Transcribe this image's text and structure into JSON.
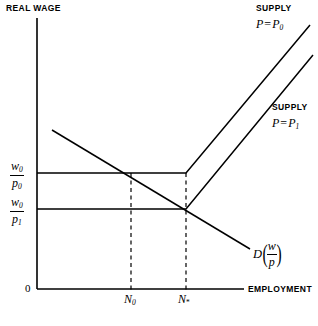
{
  "figure": {
    "kind": "economics-labor-market-diagram",
    "background_color": "#ffffff",
    "line_color": "#000000",
    "width": 318,
    "height": 326
  },
  "axes": {
    "y_axis_title": "REAL WAGE",
    "x_axis_title": "EMPLOYMENT",
    "origin_label": "0",
    "y_axis": {
      "x": 37,
      "y_top": 18,
      "y_bottom": 289
    },
    "x_axis": {
      "y": 289,
      "x_left": 37,
      "x_right": 244
    }
  },
  "y_ticks": [
    {
      "id": "w0-over-p0",
      "numerator": "w",
      "numerator_sub": "0",
      "denominator": "p",
      "denominator_sub": "0",
      "value_y": 173
    },
    {
      "id": "w0-over-p1",
      "numerator": "w",
      "numerator_sub": "0",
      "denominator": "p",
      "denominator_sub": "1",
      "value_y": 209
    }
  ],
  "x_ticks": [
    {
      "id": "N0",
      "base": "N",
      "sub": "0",
      "value_x": 131
    },
    {
      "id": "Nstar",
      "base": "N",
      "sub": "*",
      "value_x": 186
    }
  ],
  "curves": {
    "supply_p0": {
      "title_line1": "SUPPLY",
      "title_var": "P",
      "title_eq": "=",
      "title_val": "P",
      "title_val_sub": "0",
      "points": "37,173 186,173 310,25"
    },
    "supply_p1": {
      "title_line1": "SUPPLY",
      "title_var": "P",
      "title_eq": "=",
      "title_val": "P",
      "title_val_sub": "1",
      "points": "37,209 186,209 313,55"
    },
    "demand": {
      "label_d": "D",
      "label_open_paren": "(",
      "label_num": "w",
      "label_den": "p",
      "label_close_paren": ")",
      "points": "52,130 250,249"
    }
  },
  "dashed_guides": [
    {
      "id": "guide-N0",
      "x": 131,
      "y_top": 173,
      "y_bottom": 289
    },
    {
      "id": "guide-Nstar",
      "x": 186,
      "y_top": 173,
      "y_bottom": 289
    }
  ],
  "chart_data": {
    "type": "line",
    "title": "",
    "xlabel": "EMPLOYMENT",
    "ylabel": "REAL WAGE",
    "xlim": [
      0,
      1
    ],
    "ylim": [
      0,
      1
    ],
    "grid": false,
    "legend": "inline-annotations",
    "series": [
      {
        "name": "SUPPLY P = P0",
        "type": "kinked-line",
        "points": [
          [
            0.0,
            0.428
          ],
          [
            0.72,
            0.428
          ],
          [
            1.32,
            0.974
          ]
        ]
      },
      {
        "name": "SUPPLY P = P1",
        "type": "kinked-line",
        "points": [
          [
            0.0,
            0.295
          ],
          [
            0.72,
            0.295
          ],
          [
            1.33,
            0.863
          ]
        ]
      },
      {
        "name": "D(w/p)",
        "type": "line",
        "points": [
          [
            0.072,
            0.586
          ],
          [
            1.03,
            0.147
          ]
        ]
      }
    ],
    "annotations": [
      {
        "text": "w0/p0",
        "axis": "y",
        "value": 0.428
      },
      {
        "text": "w0/p1",
        "axis": "y",
        "value": 0.295
      },
      {
        "text": "N0",
        "axis": "x",
        "value": 0.454
      },
      {
        "text": "N*",
        "axis": "x",
        "value": 0.72
      }
    ]
  }
}
